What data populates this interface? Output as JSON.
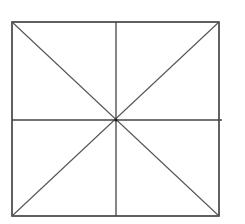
{
  "diagram": {
    "type": "geometric-figure",
    "colors": {
      "background": "#ffffff",
      "line": "#3a3a3a"
    },
    "square": {
      "x1": 12,
      "y1": 22,
      "x2": 219,
      "y2": 216
    },
    "center": {
      "x": 116,
      "y": 120
    },
    "lines": [
      {
        "name": "diagonal-top-left-to-bottom-right",
        "x1": 12,
        "y1": 22,
        "x2": 219,
        "y2": 216
      },
      {
        "name": "diagonal-top-right-to-bottom-left",
        "x1": 219,
        "y1": 22,
        "x2": 12,
        "y2": 216
      },
      {
        "name": "vertical-midline",
        "x1": 116,
        "y1": 22,
        "x2": 116,
        "y2": 216
      },
      {
        "name": "horizontal-midline",
        "x1": 12,
        "y1": 120,
        "x2": 222,
        "y2": 120
      }
    ]
  }
}
